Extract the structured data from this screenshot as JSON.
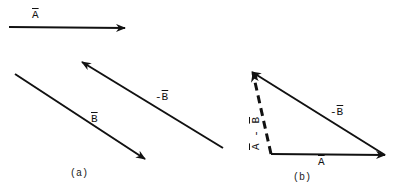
{
  "figure": {
    "panel_a": {
      "caption": "(a)",
      "vectors": [
        {
          "name": "A",
          "label": "A",
          "prefix": ""
        },
        {
          "name": "B",
          "label": "B",
          "prefix": ""
        },
        {
          "name": "neg-B",
          "label": "B",
          "prefix": "-"
        }
      ]
    },
    "panel_b": {
      "caption": "(b)",
      "vectors": [
        {
          "name": "A",
          "label": "A",
          "prefix": ""
        },
        {
          "name": "neg-B",
          "label": "B",
          "prefix": "-"
        },
        {
          "name": "A-minus-B",
          "label_a": "A",
          "op": " - ",
          "label_b": "B"
        }
      ]
    }
  },
  "colors": {
    "ink": "#111111",
    "background": "#ffffff"
  }
}
